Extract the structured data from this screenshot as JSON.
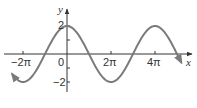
{
  "chart_data": {
    "type": "line",
    "title": "",
    "function": "y = 2cos(x/2)",
    "xlabel": "x",
    "ylabel": "y",
    "x_ticks": [
      {
        "value": -6.2832,
        "label": "-2π"
      },
      {
        "value": 0,
        "label": "0"
      },
      {
        "value": 6.2832,
        "label": "2π"
      },
      {
        "value": 12.5664,
        "label": "4π"
      }
    ],
    "y_ticks": [
      {
        "value": 2,
        "label": "2"
      },
      {
        "value": 1,
        "label": ""
      },
      {
        "value": -1,
        "label": ""
      },
      {
        "value": -2,
        "label": "-2"
      }
    ],
    "xlim": [
      -7.9,
      17.0
    ],
    "ylim": [
      -2.6,
      3.1
    ],
    "grid": false,
    "series": [
      {
        "name": "y = 2cos(x/2)",
        "x": [
          -7.854,
          -6.2832,
          -3.1416,
          0,
          3.1416,
          6.2832,
          9.4248,
          12.5664,
          15.708,
          16.34
        ],
        "y": [
          -1.414,
          -2,
          0,
          2,
          0,
          -2,
          0,
          2,
          0,
          -0.62
        ]
      }
    ],
    "colors": {
      "axis": "#333333",
      "curve": "#7a7a7a"
    }
  },
  "labels": {
    "x_axis": "x",
    "y_axis": "y",
    "tick_neg2pi": "−2π",
    "tick_zero": "0",
    "tick_2pi": "2π",
    "tick_4pi": "4π",
    "tick_y2": "2",
    "tick_yneg2": "−2"
  }
}
